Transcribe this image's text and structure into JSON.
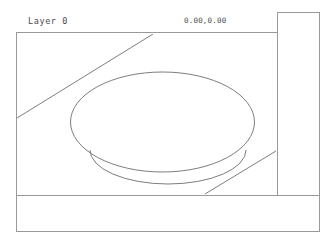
{
  "window": {
    "title": "CAD Drawing Window",
    "background_color": "#ffffff",
    "frame_color": "#9a9a9a"
  },
  "status_bar": {
    "layer_label": "Layer 0",
    "coordinates": "0.00,0.00",
    "text_color": "#4a4a4a"
  },
  "panels": {
    "side_panel_name": "right-tool-panel",
    "bottom_panel_name": "bottom-command-strip"
  },
  "drawing": {
    "stroke_color": "#6e6e6e",
    "entities": [
      {
        "name": "outer-ellipse",
        "type": "ellipse",
        "cx": 162.5,
        "cy": 122,
        "rx": 92,
        "ry": 50
      },
      {
        "name": "inner-arc",
        "type": "arc",
        "path": "M 90 150 A 78 34 0 0 0 246 150"
      },
      {
        "name": "upper-left-diagonal",
        "type": "line",
        "x1": 17,
        "y1": 118,
        "x2": 153,
        "y2": 34
      },
      {
        "name": "lower-right-diagonal",
        "type": "line",
        "x1": 205,
        "y1": 194,
        "x2": 276,
        "y2": 151
      }
    ]
  }
}
